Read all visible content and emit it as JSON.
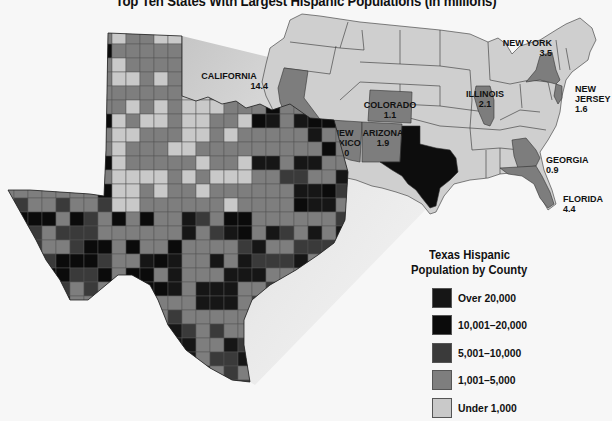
{
  "title": "Top Ten States With Largest Hispanic Populations (in millions)",
  "colors": {
    "background": "#f7f7f7",
    "state_default": "#cfcfcf",
    "state_highlight": "#7d7d7d",
    "texas_us": "#0d0d0d",
    "border": "#333333"
  },
  "us_map": {
    "labels": [
      {
        "state": "CALIFORNIA",
        "value": "14.4"
      },
      {
        "state": "COLORADO",
        "value": "1.1"
      },
      {
        "state_line1": "NEW",
        "state_line2": "MEXICO",
        "value": "1.0"
      },
      {
        "state": "ARIZONA",
        "value": "1.9"
      },
      {
        "state": "ILLINOIS",
        "value": "2.1"
      },
      {
        "state": "NEW YORK",
        "value": "3.5"
      },
      {
        "state_line1": "NEW",
        "state_line2": "JERSEY",
        "value": "1.6"
      },
      {
        "state": "GEORGIA",
        "value": "0.9"
      },
      {
        "state": "FLORIDA",
        "value": "4.4"
      }
    ]
  },
  "legend": {
    "title_line1": "Texas Hispanic",
    "title_line2": "Population by County",
    "items": [
      {
        "label": "Over 20,000",
        "color": "#161616"
      },
      {
        "label": "10,001–20,000",
        "color": "#0b0b0b"
      },
      {
        "label": "5,001–10,000",
        "color": "#3a3a3a"
      },
      {
        "label": "1,001–5,000",
        "color": "#7e7e7e"
      },
      {
        "label": "Under 1,000",
        "color": "#c9c9c9"
      }
    ]
  }
}
